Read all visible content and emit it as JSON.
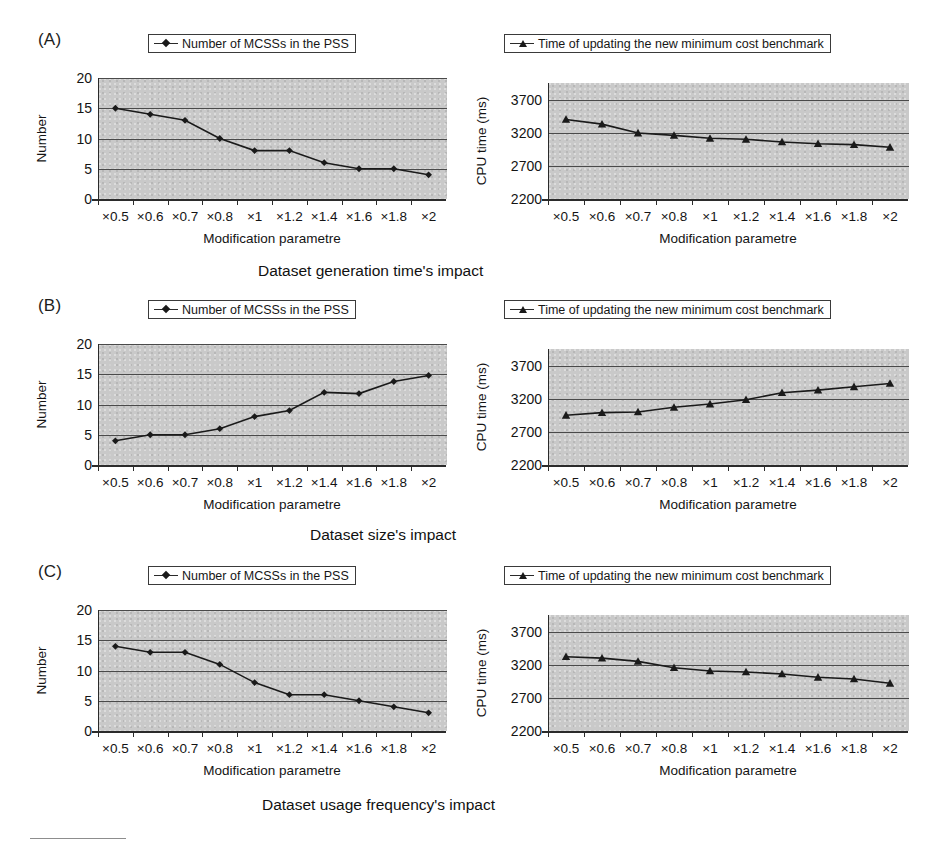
{
  "figure": {
    "panels": [
      {
        "letter": "(A)",
        "caption": "Dataset generation time's impact",
        "left_legend": "Number of MCSSs in the PSS",
        "right_legend": "Time of updating the new minimum cost benchmark",
        "left_marker": "diamond-marker",
        "right_marker": "triangle-marker"
      },
      {
        "letter": "(B)",
        "caption": "Dataset size's impact",
        "left_legend": "Number of MCSSs in the PSS",
        "right_legend": "Time of updating the new minimum cost benchmark",
        "left_marker": "diamond-marker",
        "right_marker": "triangle-marker"
      },
      {
        "letter": "(C)",
        "caption": "Dataset usage frequency's impact",
        "left_legend": "Number of MCSSs in the PSS",
        "right_legend": "Time of updating the new minimum cost benchmark",
        "left_marker": "diamond-marker",
        "right_marker": "triangle-marker"
      }
    ],
    "axis_labels": {
      "x": "Modification parametre",
      "y_number": "Number",
      "y_cpu": "CPU time (ms)"
    },
    "colors": {
      "plot_background": "#c9c9c9",
      "line": "#1a1a1a",
      "gridline": "#4a4a4a",
      "axis": "#2b2b2b",
      "text": "#141414"
    }
  },
  "chart_data": [
    {
      "type": "line",
      "title": "(A) left - Number of MCSSs in the PSS",
      "panel": "A",
      "position": "left",
      "categories": [
        "×0.5",
        "×0.6",
        "×0.7",
        "×0.8",
        "×1",
        "×1.2",
        "×1.4",
        "×1.6",
        "×1.8",
        "×2"
      ],
      "values": [
        15,
        14,
        13,
        10,
        8,
        8,
        6,
        5,
        5,
        4
      ],
      "series_name": "Number of MCSSs in the PSS",
      "marker": "diamond",
      "xlabel": "Modification parametre",
      "ylabel": "Number",
      "ylim": [
        0,
        20
      ],
      "yticks": [
        0,
        5,
        10,
        15,
        20
      ],
      "grid": true,
      "legend_position": "top"
    },
    {
      "type": "line",
      "title": "(A) right - Time of updating the new minimum cost benchmark",
      "panel": "A",
      "position": "right",
      "categories": [
        "×0.5",
        "×0.6",
        "×0.7",
        "×0.8",
        "×1",
        "×1.2",
        "×1.4",
        "×1.6",
        "×1.8",
        "×2"
      ],
      "values": [
        3400,
        3330,
        3195,
        3160,
        3115,
        3100,
        3060,
        3035,
        3020,
        2980
      ],
      "series_name": "Time of updating the new minimum cost benchmark",
      "marker": "triangle",
      "xlabel": "Modification parametre",
      "ylabel": "CPU time (ms)",
      "ylim": [
        2200,
        3950
      ],
      "yticks": [
        2200,
        2700,
        3200,
        3700
      ],
      "grid": true,
      "legend_position": "top"
    },
    {
      "type": "line",
      "title": "(B) left - Number of MCSSs in the PSS",
      "panel": "B",
      "position": "left",
      "categories": [
        "×0.5",
        "×0.6",
        "×0.7",
        "×0.8",
        "×1",
        "×1.2",
        "×1.4",
        "×1.6",
        "×1.8",
        "×2"
      ],
      "values": [
        4,
        5,
        5,
        6,
        8,
        9,
        12,
        11.8,
        13.8,
        14.8
      ],
      "series_name": "Number of MCSSs in the PSS",
      "marker": "diamond",
      "xlabel": "Modification parametre",
      "ylabel": "Number",
      "ylim": [
        0,
        20
      ],
      "yticks": [
        0,
        5,
        10,
        15,
        20
      ],
      "grid": true,
      "legend_position": "top"
    },
    {
      "type": "line",
      "title": "(B) right - Time of updating the new minimum cost benchmark",
      "panel": "B",
      "position": "right",
      "categories": [
        "×0.5",
        "×0.6",
        "×0.7",
        "×0.8",
        "×1",
        "×1.2",
        "×1.4",
        "×1.6",
        "×1.8",
        "×2"
      ],
      "values": [
        2950,
        2990,
        3000,
        3070,
        3120,
        3185,
        3290,
        3330,
        3380,
        3430
      ],
      "series_name": "Time of updating the new minimum cost benchmark",
      "marker": "triangle",
      "xlabel": "Modification parametre",
      "ylabel": "CPU time (ms)",
      "ylim": [
        2200,
        3950
      ],
      "yticks": [
        2200,
        2700,
        3200,
        3700
      ],
      "grid": true,
      "legend_position": "top"
    },
    {
      "type": "line",
      "title": "(C) left - Number of MCSSs in the PSS",
      "panel": "C",
      "position": "left",
      "categories": [
        "×0.5",
        "×0.6",
        "×0.7",
        "×0.8",
        "×1",
        "×1.2",
        "×1.4",
        "×1.6",
        "×1.8",
        "×2"
      ],
      "values": [
        14,
        13,
        13,
        11,
        8,
        6,
        6,
        5,
        4,
        3
      ],
      "series_name": "Number of MCSSs in the PSS",
      "marker": "diamond",
      "xlabel": "Modification parametre",
      "ylabel": "Number",
      "ylim": [
        0,
        20
      ],
      "yticks": [
        0,
        5,
        10,
        15,
        20
      ],
      "grid": true,
      "legend_position": "top"
    },
    {
      "type": "line",
      "title": "(C) right - Time of updating the new minimum cost benchmark",
      "panel": "C",
      "position": "right",
      "categories": [
        "×0.5",
        "×0.6",
        "×0.7",
        "×0.8",
        "×1",
        "×1.2",
        "×1.4",
        "×1.6",
        "×1.8",
        "×2"
      ],
      "values": [
        3320,
        3300,
        3250,
        3155,
        3105,
        3090,
        3060,
        3010,
        2985,
        2920
      ],
      "series_name": "Time of updating the new minimum cost benchmark",
      "marker": "triangle",
      "xlabel": "Modification parametre",
      "ylabel": "CPU time (ms)",
      "ylim": [
        2200,
        3950
      ],
      "yticks": [
        2200,
        2700,
        3200,
        3700
      ],
      "grid": true,
      "legend_position": "top"
    }
  ]
}
